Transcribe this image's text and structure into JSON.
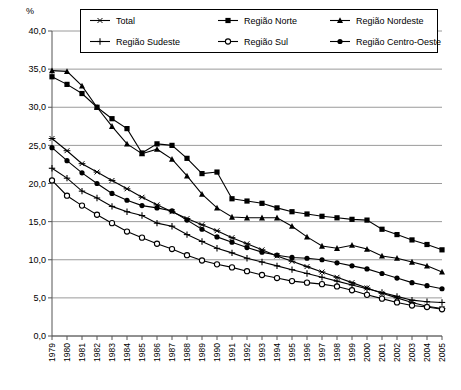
{
  "axis": {
    "unit_label": "%",
    "y_ticks": [
      "40,0",
      "35,0",
      "30,0",
      "25,0",
      "20,0",
      "15,0",
      "10,0",
      "5,0",
      "0,0"
    ],
    "y_min": 0,
    "y_max": 40,
    "y_step": 5
  },
  "legend": {
    "items": [
      {
        "label": "Total",
        "marker": "star"
      },
      {
        "label": "Região Norte",
        "marker": "square"
      },
      {
        "label": "Região Nordeste",
        "marker": "triangle"
      },
      {
        "label": "Região Sudeste",
        "marker": "plus"
      },
      {
        "label": "Região Sul",
        "marker": "circle-open"
      },
      {
        "label": "Região Centro-Oeste",
        "marker": "circle-filled"
      }
    ]
  },
  "caption": "",
  "chart_data": {
    "type": "line",
    "title": "",
    "xlabel": "",
    "ylabel": "%",
    "ylim": [
      0,
      40
    ],
    "ytick_step": 5,
    "grid": true,
    "legend_position": "top",
    "categories": [
      "1979",
      "1980",
      "1981",
      "1982",
      "1983",
      "1984",
      "1985",
      "1986",
      "1987",
      "1988",
      "1989",
      "1990",
      "1991",
      "1992",
      "1993",
      "1994",
      "1995",
      "1996",
      "1997",
      "1998",
      "1999",
      "2000",
      "2001",
      "2002",
      "2003",
      "2004",
      "2005"
    ],
    "series": [
      {
        "name": "Total",
        "marker": "star",
        "values": [
          25.9,
          24.3,
          22.6,
          21.5,
          20.4,
          19.3,
          18.2,
          17.2,
          16.3,
          15.4,
          14.6,
          13.8,
          12.9,
          12.1,
          11.3,
          10.5,
          9.8,
          9.1,
          8.4,
          7.7,
          7.0,
          6.3,
          5.6,
          5.0,
          4.4,
          3.9,
          3.6
        ]
      },
      {
        "name": "Região Norte",
        "marker": "square",
        "values": [
          34.0,
          33.0,
          31.8,
          30.0,
          28.5,
          27.2,
          24.0,
          25.2,
          25.0,
          23.3,
          21.3,
          21.5,
          18.0,
          17.7,
          17.4,
          16.8,
          16.3,
          16.0,
          15.7,
          15.5,
          15.3,
          15.2,
          14.0,
          13.3,
          12.6,
          12.0,
          11.3
        ]
      },
      {
        "name": "Região Nordeste",
        "marker": "triangle",
        "values": [
          34.8,
          34.7,
          32.8,
          30.0,
          27.5,
          25.2,
          23.9,
          24.5,
          23.2,
          21.0,
          18.6,
          16.8,
          15.6,
          15.5,
          15.5,
          15.5,
          14.4,
          13.0,
          11.8,
          11.5,
          11.9,
          11.4,
          10.5,
          10.2,
          9.7,
          9.2,
          8.4
        ]
      },
      {
        "name": "Região Sudeste",
        "marker": "plus",
        "values": [
          22.0,
          20.7,
          19.0,
          18.1,
          17.0,
          16.3,
          15.8,
          14.8,
          14.4,
          13.3,
          12.4,
          11.5,
          10.9,
          10.2,
          9.7,
          9.2,
          8.7,
          8.2,
          7.7,
          7.2,
          6.7,
          6.2,
          5.7,
          5.2,
          4.7,
          4.5,
          4.4
        ]
      },
      {
        "name": "Região Sul",
        "marker": "circle-open",
        "values": [
          20.4,
          18.4,
          17.1,
          15.9,
          14.8,
          13.7,
          12.9,
          12.1,
          11.4,
          10.6,
          9.9,
          9.4,
          9.0,
          8.5,
          8.0,
          7.6,
          7.2,
          7.0,
          6.8,
          6.5,
          6.0,
          5.4,
          4.9,
          4.4,
          4.0,
          3.8,
          3.5
        ]
      },
      {
        "name": "Região Centro-Oeste",
        "marker": "circle-filled",
        "values": [
          24.7,
          23.0,
          21.4,
          20.0,
          18.7,
          17.8,
          17.1,
          16.8,
          16.4,
          15.2,
          14.0,
          13.0,
          12.3,
          11.6,
          11.0,
          10.6,
          10.3,
          10.2,
          10.0,
          9.6,
          9.2,
          8.8,
          8.2,
          7.6,
          7.0,
          6.6,
          6.2
        ]
      }
    ]
  }
}
